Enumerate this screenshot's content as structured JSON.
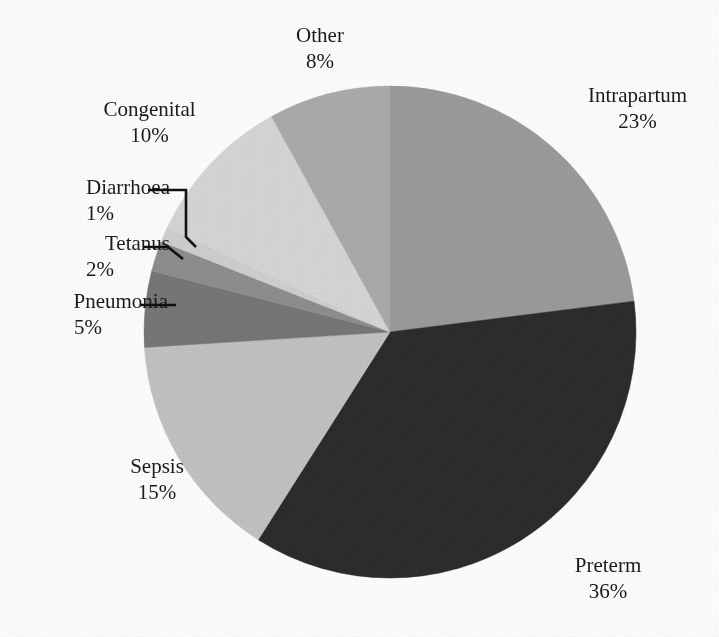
{
  "page": {
    "cropped_running_title": "",
    "background": "#fefefe"
  },
  "chart_data": {
    "type": "pie",
    "title": "",
    "subtitle": "",
    "xlabel": "",
    "ylabel": "",
    "legend_position": "none",
    "grid": false,
    "label_format": "name on first line, percent on second line",
    "start_angle_deg": 0,
    "direction": "clockwise",
    "units": "%",
    "total": 100,
    "categories": [
      "Intrapartum",
      "Preterm",
      "Sepsis",
      "Pneumonia",
      "Tetanus",
      "Diarrhoea",
      "Congenital",
      "Other"
    ],
    "values": [
      23,
      36,
      15,
      5,
      2,
      1,
      10,
      8
    ],
    "slices": [
      {
        "label": "Intrapartum",
        "value": 23,
        "percent_text": "23%",
        "color": "#9b9b9b",
        "leader": false
      },
      {
        "label": "Preterm",
        "value": 36,
        "percent_text": "36%",
        "color": "#2c2c2c",
        "leader": false
      },
      {
        "label": "Sepsis",
        "value": 15,
        "percent_text": "15%",
        "color": "#c2c2c2",
        "leader": false
      },
      {
        "label": "Pneumonia",
        "value": 5,
        "percent_text": "5%",
        "color": "#777777",
        "leader": true
      },
      {
        "label": "Tetanus",
        "value": 2,
        "percent_text": "2%",
        "color": "#8e8e8e",
        "leader": true
      },
      {
        "label": "Diarrhoea",
        "value": 1,
        "percent_text": "1%",
        "color": "#cfcfcf",
        "leader": true
      },
      {
        "label": "Congenital",
        "value": 10,
        "percent_text": "10%",
        "color": "#d6d6d6",
        "leader": false
      },
      {
        "label": "Other",
        "value": 8,
        "percent_text": "8%",
        "color": "#ababab",
        "leader": false
      }
    ]
  },
  "labels": {
    "other": {
      "name": "Other",
      "pct": "8%"
    },
    "intrapartum": {
      "name": "Intrapartum",
      "pct": "23%"
    },
    "congenital": {
      "name": "Congenital",
      "pct": "10%"
    },
    "diarrhoea": {
      "name": "Diarrhoea",
      "pct": "1%"
    },
    "tetanus": {
      "name": "Tetanus",
      "pct": "2%"
    },
    "pneumonia": {
      "name": "Pneumonia",
      "pct": "5%"
    },
    "sepsis": {
      "name": "Sepsis",
      "pct": "15%"
    },
    "preterm": {
      "name": "Preterm",
      "pct": "36%"
    }
  },
  "colors": {
    "line": "#111111",
    "text": "#1b1b1b",
    "paper": "#fefefe"
  }
}
